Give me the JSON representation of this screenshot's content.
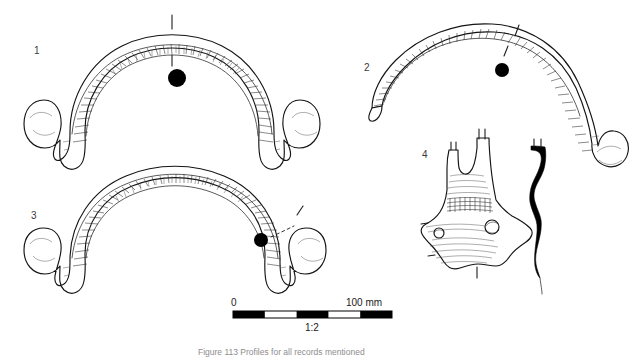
{
  "plate": {
    "title_caption": "Figure 113 Profiles for all records mentioned",
    "caption_visible_fragment": "Figure 113  Profiles for all records mentioned",
    "background_color": "#ffffff",
    "ink_color": "#1c1c1c"
  },
  "figures": [
    {
      "id": "1",
      "label": "1",
      "type": "curved-arc-object-with-hooked-terminals",
      "description": "Large arched bronze object, hatched along upper arc, both ends curl into hooks",
      "label_x": 36,
      "label_y": 51,
      "section_dot": {
        "x": 177,
        "y": 78,
        "r": 9
      },
      "section_tick_top": {
        "x": 172,
        "y": 16,
        "length": 14
      },
      "section_tick_bottom": {
        "x": 172,
        "y": 56,
        "length": 12
      }
    },
    {
      "id": "2",
      "label": "2",
      "type": "curved-arc-object-asymmetric",
      "description": "Asymmetric arched object, tapered left terminal, large hooked right terminal",
      "label_x": 366,
      "label_y": 69,
      "section_dot": {
        "x": 502,
        "y": 70,
        "r": 7
      },
      "section_tick_top": {
        "x": 516,
        "y": 29,
        "length": 11
      },
      "section_tick_bottom": {
        "x": 506,
        "y": 51,
        "length": 10
      }
    },
    {
      "id": "3",
      "label": "3",
      "type": "curved-arc-object-with-hooked-terminals",
      "description": "Arched object with both terminals curling inward into open hooks",
      "label_x": 33,
      "label_y": 216,
      "section_dot": {
        "x": 261,
        "y": 240,
        "r": 7
      },
      "section_tick_top": {
        "x": 300,
        "y": 210,
        "length": 10
      },
      "section_tick_bottom": {
        "x": 281,
        "y": 231,
        "length": 10
      }
    },
    {
      "id": "4",
      "label": "4",
      "type": "shaft-hole-fragment-with-profile",
      "description": "Flared socketed fragment with two circular perforations and cross-hatched band; black side profile at right",
      "label_x": 424,
      "label_y": 156,
      "section_tick_bottom": {
        "x": 477,
        "y": 265,
        "length": 11
      },
      "perforations": [
        {
          "x": 439,
          "y": 233,
          "r": 5
        },
        {
          "x": 492,
          "y": 227,
          "r": 7
        }
      ]
    }
  ],
  "scale": {
    "zero_label": "0",
    "max_label": "100 mm",
    "ratio_label": "1:2",
    "bar_x": 233,
    "bar_y": 311,
    "bar_width": 159,
    "bar_height": 7,
    "segments": 5,
    "segment_colors": [
      "#000000",
      "#ffffff",
      "#000000",
      "#ffffff",
      "#000000"
    ]
  }
}
